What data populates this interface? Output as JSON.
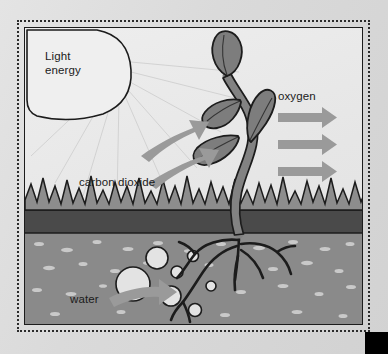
{
  "diagram": {
    "labels": {
      "light_energy": "Light\nenergy",
      "light_energy_line1": "Light",
      "light_energy_line2": "energy",
      "carbon_dioxide": "carbon dioxide",
      "oxygen": "oxygen",
      "water": "water"
    },
    "elements": {
      "sun": "sun-shape",
      "light_rays": "light-ray-lines",
      "plant": "seedling-plant",
      "leaves_count": 4,
      "roots": "root-system",
      "grass": "grass-sawtooth-layer",
      "topsoil": "dark-topsoil-band",
      "subsoil": "speckled-soil-layer",
      "water_droplets": 7,
      "oxygen_arrows": 3,
      "carbon_dioxide_arrows": 2,
      "water_arrow": 1
    },
    "colors": {
      "page_background": "#dcdcdc",
      "panel_background": "#ebebeb",
      "frame_dots": "#2b2b2b",
      "panel_border": "#1c1c1c",
      "outline": "#1c1c1c",
      "arrow_gray": "#9a9a9a",
      "plant_gray": "#7d7d7d",
      "stem_gray": "#828282",
      "grass_gray": "#8d8d8d",
      "topsoil_dark": "#4a4a4a",
      "soil_gray": "#8a8a8a",
      "soil_speckle": "#c9c9c9",
      "droplet_fill": "#e3e3e3",
      "ray_gray": "#cfcfcf",
      "corner_block": "#000000",
      "text": "#1b1b1b"
    }
  }
}
